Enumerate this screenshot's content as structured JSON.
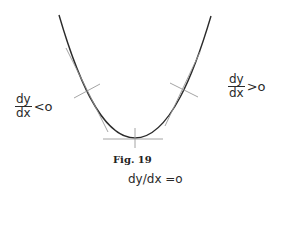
{
  "figure": {
    "caption": "Fig. 19",
    "curve": {
      "type": "parabola",
      "stroke": "#2b2b2b",
      "minimum_point": [
        135,
        138
      ]
    },
    "tangent_color": "#9a9a9a",
    "labels": {
      "left": {
        "numerator": "dy",
        "denominator": "dx",
        "relation": "<o"
      },
      "right": {
        "numerator": "dy",
        "denominator": "dx",
        "relation": ">o"
      },
      "bottom": "dy/dx =o"
    }
  }
}
